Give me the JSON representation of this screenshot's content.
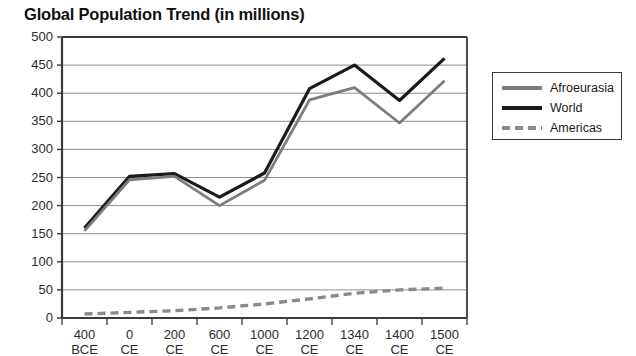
{
  "chart_data": {
    "type": "line",
    "title": "Global Population Trend (in millions)",
    "xlabel": "",
    "ylabel": "",
    "ylim": [
      0,
      500
    ],
    "yticks": [
      0,
      50,
      100,
      150,
      200,
      250,
      300,
      350,
      400,
      450,
      500
    ],
    "grid": true,
    "legend_position": "right",
    "categories": [
      "400 BCE",
      "0 CE",
      "200 CE",
      "600 CE",
      "1000 CE",
      "1200 CE",
      "1340 CE",
      "1400 CE",
      "1500 CE"
    ],
    "x_tick_values": [
      "400",
      "0",
      "200",
      "600",
      "1000",
      "1200",
      "1340",
      "1400",
      "1500"
    ],
    "x_tick_eras": [
      "BCE",
      "CE",
      "CE",
      "CE",
      "CE",
      "CE",
      "CE",
      "CE",
      "CE"
    ],
    "series": [
      {
        "name": "World",
        "color": "#1a1a1a",
        "style": "solid",
        "values": [
          160,
          252,
          257,
          215,
          258,
          408,
          450,
          387,
          462
        ]
      },
      {
        "name": "Afroeurasia",
        "color": "#7d7d7d",
        "style": "solid",
        "values": [
          155,
          246,
          252,
          200,
          245,
          388,
          410,
          347,
          422
        ]
      },
      {
        "name": "Americas",
        "color": "#8a8a8a",
        "style": "dashed",
        "values": [
          7,
          10,
          13,
          18,
          25,
          34,
          44,
          50,
          53
        ]
      }
    ]
  },
  "legend": {
    "items": [
      {
        "label": "Afroeurasia"
      },
      {
        "label": "World"
      },
      {
        "label": "Americas"
      }
    ]
  }
}
